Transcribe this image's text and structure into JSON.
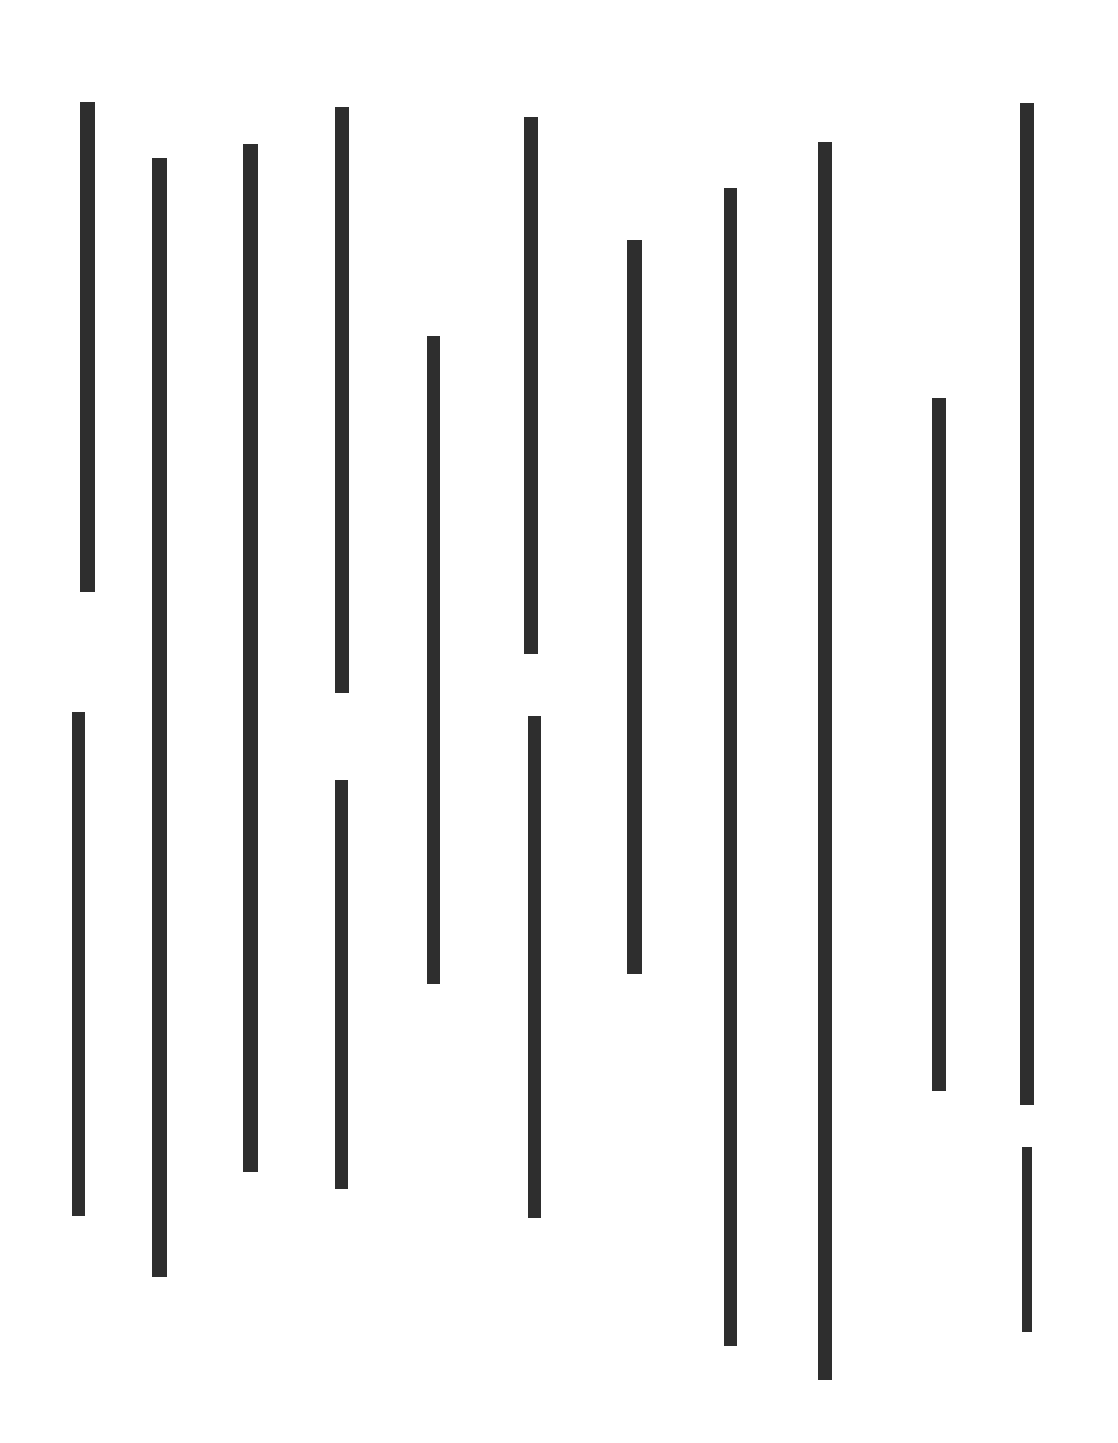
{
  "canvas": {
    "width": 1118,
    "height": 1443,
    "background": "#ffffff",
    "bar_color": "#2e2e2e"
  },
  "segments": [
    {
      "id": "col1-top",
      "x": 80,
      "y": 102,
      "w": 15,
      "h": 490
    },
    {
      "id": "col1-bottom",
      "x": 72,
      "y": 712,
      "w": 13,
      "h": 504
    },
    {
      "id": "col2",
      "x": 152,
      "y": 158,
      "w": 15,
      "h": 1119
    },
    {
      "id": "col3",
      "x": 243,
      "y": 144,
      "w": 15,
      "h": 1028
    },
    {
      "id": "col4-top",
      "x": 335,
      "y": 107,
      "w": 14,
      "h": 586
    },
    {
      "id": "col4-bottom",
      "x": 335,
      "y": 780,
      "w": 13,
      "h": 409
    },
    {
      "id": "col5",
      "x": 427,
      "y": 336,
      "w": 13,
      "h": 648
    },
    {
      "id": "col6-top",
      "x": 524,
      "y": 117,
      "w": 14,
      "h": 537
    },
    {
      "id": "col6-bottom",
      "x": 528,
      "y": 716,
      "w": 13,
      "h": 502
    },
    {
      "id": "col7",
      "x": 627,
      "y": 240,
      "w": 15,
      "h": 734
    },
    {
      "id": "col8",
      "x": 724,
      "y": 188,
      "w": 13,
      "h": 1158
    },
    {
      "id": "col9",
      "x": 818,
      "y": 142,
      "w": 14,
      "h": 1238
    },
    {
      "id": "col10",
      "x": 932,
      "y": 398,
      "w": 14,
      "h": 693
    },
    {
      "id": "col11-top",
      "x": 1020,
      "y": 103,
      "w": 14,
      "h": 1002
    },
    {
      "id": "col11-bottom",
      "x": 1022,
      "y": 1147,
      "w": 10,
      "h": 185
    }
  ]
}
